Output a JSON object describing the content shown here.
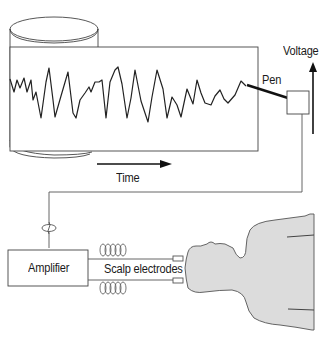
{
  "diagram": {
    "labels": {
      "voltage": "Voltage",
      "pen": "Pen",
      "time": "Time",
      "amplifier": "Amplifier",
      "scalp_electrodes": "Scalp electrodes"
    },
    "components": [
      {
        "id": "paper-drum",
        "type": "rotating cylinder with paper strip"
      },
      {
        "id": "eeg-trace",
        "type": "waveform"
      },
      {
        "id": "pen",
        "type": "recording pen"
      },
      {
        "id": "pen-driver-box",
        "type": "box"
      },
      {
        "id": "amplifier",
        "type": "box"
      },
      {
        "id": "scalp-electrodes",
        "type": "electrodes x2"
      },
      {
        "id": "subject",
        "type": "head and shoulders silhouette"
      }
    ],
    "arrows": [
      {
        "label": "Voltage",
        "direction": "up"
      },
      {
        "label": "Time",
        "direction": "right"
      }
    ],
    "colors": {
      "line": "#2a2a2a",
      "body_fill": "#dcdcdc",
      "background": "#ffffff"
    }
  }
}
